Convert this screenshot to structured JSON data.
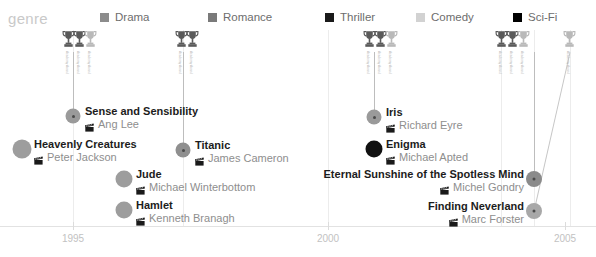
{
  "legend": {
    "title": "genre",
    "items": [
      {
        "label": "Drama",
        "color": "#8c8c8c",
        "x": 100
      },
      {
        "label": "Romance",
        "color": "#7a7a7a",
        "x": 208
      },
      {
        "label": "Thriller",
        "color": "#1a1a1a",
        "x": 325
      },
      {
        "label": "Comedy",
        "color": "#d2d2d2",
        "x": 416
      },
      {
        "label": "Sci-Fi",
        "color": "#000000",
        "x": 513
      }
    ]
  },
  "axis": {
    "ticks": [
      {
        "label": "1995",
        "x": 73
      },
      {
        "label": "2000",
        "x": 328
      },
      {
        "label": "2005",
        "x": 565
      }
    ],
    "gridlines": [
      73,
      183,
      328,
      501,
      534,
      570
    ]
  },
  "chart_data": {
    "type": "scatter",
    "title": "genre",
    "xlabel": "",
    "ylabel": "",
    "xlim": [
      1993.5,
      2005.5
    ],
    "grid": true,
    "legend_position": "top",
    "categories": [
      "Drama",
      "Romance",
      "Thriller",
      "Comedy",
      "Sci-Fi"
    ],
    "series": [
      {
        "name": "films",
        "points": [
          {
            "film": "Sense and Sensibility",
            "director": "Ang Lee",
            "genre": "Romance",
            "year": 1995,
            "awards": 3
          },
          {
            "film": "Heavenly Creatures",
            "director": "Peter Jackson",
            "genre": "Drama",
            "year": 1994,
            "awards": 0
          },
          {
            "film": "Titanic",
            "director": "James Cameron",
            "genre": "Romance",
            "year": 1997,
            "awards": 2
          },
          {
            "film": "Jude",
            "director": "Michael Winterbottom",
            "genre": "Drama",
            "year": 1996,
            "awards": 0
          },
          {
            "film": "Hamlet",
            "director": "Kenneth Branagh",
            "genre": "Drama",
            "year": 1996,
            "awards": 0
          },
          {
            "film": "Iris",
            "director": "Richard Eyre",
            "genre": "Drama",
            "year": 2001,
            "awards": 3
          },
          {
            "film": "Enigma",
            "director": "Michael Apted",
            "genre": "Thriller",
            "year": 2001,
            "awards": 0
          },
          {
            "film": "Eternal Sunshine of the Spotless Mind",
            "director": "Michel Gondry",
            "genre": "Sci-Fi",
            "year": 2004,
            "awards": 3
          },
          {
            "film": "Finding Neverland",
            "director": "Marc Forster",
            "genre": "Drama",
            "year": 2004,
            "awards": 1
          }
        ]
      }
    ]
  },
  "films": [
    {
      "title": "Sense and Sensibility",
      "director": "Ang Lee",
      "dot": {
        "x": 73,
        "y": 86,
        "size": 15,
        "color": "#9a9a9a",
        "core": true
      },
      "label": {
        "x": 85,
        "y": 75,
        "align": "left"
      }
    },
    {
      "title": "Heavenly Creatures",
      "director": "Peter Jackson",
      "dot": {
        "x": 22,
        "y": 119,
        "size": 19,
        "color": "#9d9d9d",
        "core": false
      },
      "label": {
        "x": 34,
        "y": 108,
        "align": "left"
      }
    },
    {
      "title": "Titanic",
      "director": "James Cameron",
      "dot": {
        "x": 183,
        "y": 120,
        "size": 15,
        "color": "#8f8f8f",
        "core": true
      },
      "label": {
        "x": 195,
        "y": 109,
        "align": "left"
      }
    },
    {
      "title": "Jude",
      "director": "Michael Winterbottom",
      "dot": {
        "x": 124,
        "y": 149,
        "size": 17,
        "color": "#9d9d9d",
        "core": false
      },
      "label": {
        "x": 136,
        "y": 138,
        "align": "left"
      }
    },
    {
      "title": "Hamlet",
      "director": "Kenneth Branagh",
      "dot": {
        "x": 124,
        "y": 180,
        "size": 17,
        "color": "#9d9d9d",
        "core": false
      },
      "label": {
        "x": 136,
        "y": 169,
        "align": "left"
      }
    },
    {
      "title": "Iris",
      "director": "Richard Eyre",
      "dot": {
        "x": 374,
        "y": 87,
        "size": 15,
        "color": "#9a9a9a",
        "core": true
      },
      "label": {
        "x": 386,
        "y": 76,
        "align": "left"
      }
    },
    {
      "title": "Enigma",
      "director": "Michael Apted",
      "dot": {
        "x": 374,
        "y": 119,
        "size": 17,
        "color": "#111111",
        "core": false
      },
      "label": {
        "x": 386,
        "y": 108,
        "align": "left"
      }
    },
    {
      "title": "Eternal Sunshine of the Spotless Mind",
      "director": "Michel Gondry",
      "dot": {
        "x": 534,
        "y": 149,
        "size": 16,
        "color": "#8b8b8b",
        "core": true
      },
      "label": {
        "x": 524,
        "y": 138,
        "align": "right"
      }
    },
    {
      "title": "Finding Neverland",
      "director": "Marc Forster",
      "dot": {
        "x": 534,
        "y": 181,
        "size": 16,
        "color": "#a8a8a8",
        "core": true
      },
      "label": {
        "x": 524,
        "y": 170,
        "align": "right"
      }
    }
  ],
  "award_groups": [
    {
      "x": 62,
      "items": [
        {
          "text": "Academy Award",
          "dark": true
        },
        {
          "text": "Academy Award",
          "dark": true
        },
        {
          "text": "Academy Award",
          "dark": false
        }
      ]
    },
    {
      "x": 175,
      "items": [
        {
          "text": "Academy Award",
          "dark": true
        },
        {
          "text": "Academy Award",
          "dark": true
        }
      ]
    },
    {
      "x": 363,
      "items": [
        {
          "text": "Academy Award",
          "dark": true
        },
        {
          "text": "Academy Award",
          "dark": true
        },
        {
          "text": "Academy Award",
          "dark": false
        }
      ]
    },
    {
      "x": 495,
      "items": [
        {
          "text": "Academy Award",
          "dark": true
        },
        {
          "text": "Academy Award",
          "dark": true
        },
        {
          "text": "Academy Award",
          "dark": false
        }
      ]
    },
    {
      "x": 563,
      "items": [
        {
          "text": "Academy Award",
          "dark": false
        }
      ]
    }
  ],
  "connectors": [
    {
      "x": 73,
      "top": 22,
      "height": 64
    },
    {
      "x": 183,
      "top": 22,
      "height": 98
    },
    {
      "x": 374,
      "top": 22,
      "height": 65
    },
    {
      "x": 534,
      "top": 22,
      "height": 127
    }
  ],
  "diagonal_connector": {
    "x1": 570,
    "y1": 22,
    "x2": 534,
    "y2": 181
  }
}
